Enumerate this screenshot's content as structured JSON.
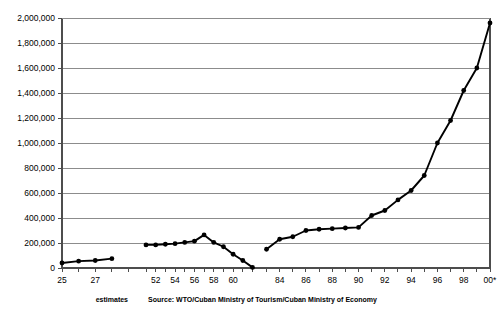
{
  "chart_data": {
    "type": "line",
    "title": "",
    "subtitle": "",
    "xlabel": "",
    "ylabel": "",
    "ylim": [
      0,
      2000000
    ],
    "ytick_values": [
      0,
      200000,
      400000,
      600000,
      800000,
      1000000,
      1200000,
      1400000,
      1600000,
      1800000,
      2000000
    ],
    "ytick_labels": [
      "0",
      "200,000",
      "400,000",
      "600,000",
      "800,000",
      "1,000,000",
      "1,200,000",
      "1,400,000",
      "1,600,000",
      "1,800,000",
      "2,000,000"
    ],
    "xlim": [
      1925,
      2000
    ],
    "xtick_labels": [
      "25",
      "27",
      "52",
      "54",
      "56",
      "58",
      "60",
      "84",
      "86",
      "88",
      "90",
      "92",
      "94",
      "96",
      "98",
      "00*"
    ],
    "xtick_years": [
      1925,
      1927,
      1952,
      1954,
      1956,
      1958,
      1960,
      1984,
      1986,
      1988,
      1990,
      1992,
      1994,
      1996,
      1998,
      2000
    ],
    "grid": "horizontal",
    "legend": "none",
    "annotations": [
      {
        "name": "estimates-note",
        "text": "estimates",
        "x_year": 1928
      },
      {
        "name": "source-note",
        "text": "Source: WTO/Cuban Ministry of Tourism/Cuban Ministry of Economy",
        "x_year": 1977
      }
    ],
    "series": [
      {
        "name": "Cuba visitor arrivals (1925-1928 estimates)",
        "color": "#000000",
        "x": [
          1925,
          1926,
          1927,
          1928
        ],
        "values": [
          40000,
          55000,
          60000,
          75000
        ]
      },
      {
        "name": "Cuba visitor arrivals (1951-1962)",
        "color": "#000000",
        "x": [
          1951,
          1952,
          1953,
          1954,
          1955,
          1956,
          1957,
          1958,
          1959,
          1960,
          1961,
          1962
        ],
        "values": [
          185000,
          185000,
          190000,
          195000,
          205000,
          215000,
          265000,
          205000,
          170000,
          110000,
          60000,
          5000
        ]
      },
      {
        "name": "Cuba visitor arrivals (1983-2000)",
        "color": "#000000",
        "x": [
          1983,
          1984,
          1985,
          1986,
          1987,
          1988,
          1989,
          1990,
          1991,
          1992,
          1993,
          1994,
          1995,
          1996,
          1997,
          1998,
          1999,
          2000
        ],
        "values": [
          150000,
          230000,
          250000,
          300000,
          310000,
          315000,
          320000,
          325000,
          420000,
          460000,
          545000,
          620000,
          740000,
          1000000,
          1180000,
          1420000,
          1600000,
          1960000
        ]
      }
    ]
  },
  "colors": {
    "series": "#000000",
    "gridline": "#8c8c8c",
    "axis": "#4d4d4d",
    "background": "#ffffff"
  }
}
